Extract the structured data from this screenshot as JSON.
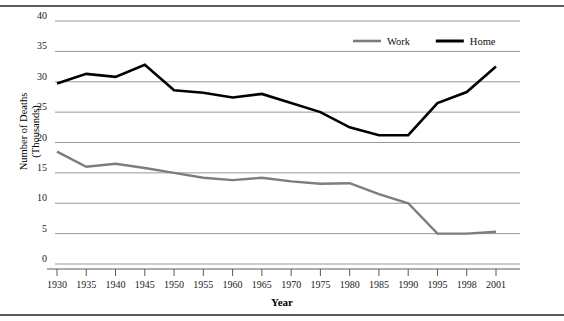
{
  "chart_data": {
    "type": "line",
    "title": "",
    "xlabel": "Year",
    "ylabel": "Number of Deaths\n(Thousands)",
    "ylabel_line1": "Number of Deaths",
    "ylabel_line2": "(Thousands)",
    "categories": [
      "1930",
      "1935",
      "1940",
      "1945",
      "1950",
      "1955",
      "1960",
      "1965",
      "1970",
      "1975",
      "1980",
      "1985",
      "1990",
      "1995",
      "1998",
      "2001"
    ],
    "x_tick_labels": [
      "1930",
      "1935",
      "1940",
      "1945",
      "1950",
      "1955",
      "1960",
      "1965",
      "1970",
      "1975",
      "1980",
      "1985",
      "1990",
      "1995",
      "1998",
      "2001"
    ],
    "y_tick_labels": [
      "0",
      "5",
      "10",
      "15",
      "20",
      "25",
      "30",
      "35",
      "40"
    ],
    "y_ticks": [
      0,
      5,
      10,
      15,
      20,
      25,
      30,
      35,
      40
    ],
    "ylim": [
      0,
      40
    ],
    "grid": true,
    "legend_position": "top-center",
    "series": [
      {
        "name": "Work",
        "color": "#7d7d7d",
        "values": [
          18.5,
          16.0,
          16.5,
          15.8,
          15.0,
          14.2,
          13.8,
          14.2,
          13.6,
          13.2,
          13.3,
          11.5,
          10.0,
          5.0,
          5.0,
          5.3
        ]
      },
      {
        "name": "Home",
        "color": "#000000",
        "values": [
          29.7,
          31.3,
          30.8,
          32.8,
          28.6,
          28.2,
          27.4,
          28.0,
          26.5,
          25.0,
          22.5,
          21.2,
          21.2,
          26.5,
          28.3,
          32.5
        ]
      }
    ],
    "legend": [
      {
        "label": "Work",
        "color": "#7d7d7d"
      },
      {
        "label": "Home",
        "color": "#000000"
      }
    ]
  }
}
